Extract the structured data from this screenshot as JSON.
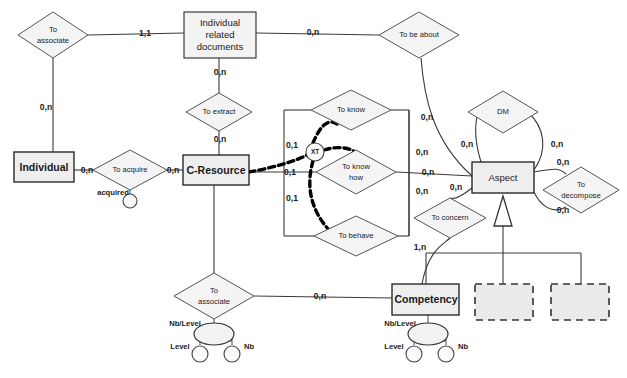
{
  "diagram": {
    "type": "entity-relationship-diagram",
    "entities": [
      {
        "id": "individual",
        "label": "Individual",
        "x": 14,
        "y": 152,
        "w": 60,
        "h": 30
      },
      {
        "id": "individual-related-documents",
        "label_lines": [
          "Individual",
          "related",
          "documents"
        ],
        "x": 184,
        "y": 12,
        "w": 72,
        "h": 46
      },
      {
        "id": "c-resource",
        "label": "C-Resource",
        "x": 183,
        "y": 155,
        "w": 66,
        "h": 30
      },
      {
        "id": "aspect",
        "label": "Aspect",
        "x": 472,
        "y": 162,
        "w": 62,
        "h": 31
      },
      {
        "id": "competency",
        "label": "Competency",
        "x": 392,
        "y": 284,
        "w": 67,
        "h": 31
      }
    ],
    "placeholder_entities": [
      {
        "id": "placeholder-1",
        "x": 475,
        "y": 284,
        "w": 58,
        "h": 36
      },
      {
        "id": "placeholder-2",
        "x": 551,
        "y": 284,
        "w": 58,
        "h": 36
      }
    ],
    "relationships": [
      {
        "id": "to-associate-top",
        "label_lines": [
          "To",
          "associate"
        ],
        "cx": 53,
        "cy": 35,
        "rx": 35,
        "ry": 23
      },
      {
        "id": "to-be-about",
        "label": "To be about",
        "cx": 419,
        "cy": 35,
        "rx": 40,
        "ry": 23
      },
      {
        "id": "to-extract",
        "label": "To extract",
        "cx": 219,
        "cy": 112,
        "rx": 33,
        "ry": 19
      },
      {
        "id": "to-acquire",
        "label": "To  acquire",
        "cx": 130,
        "cy": 170,
        "rx": 37,
        "ry": 20
      },
      {
        "id": "to-know",
        "label": "To know",
        "cx": 351,
        "cy": 110,
        "rx": 40,
        "ry": 20
      },
      {
        "id": "to-know-how",
        "label_lines": [
          "To know",
          "how"
        ],
        "cx": 356,
        "cy": 172,
        "rx": 40,
        "ry": 22
      },
      {
        "id": "to-behave",
        "label": "To behave",
        "cx": 356,
        "cy": 236,
        "rx": 42,
        "ry": 20
      },
      {
        "id": "dm",
        "label": "DM",
        "cx": 503,
        "cy": 112,
        "rx": 35,
        "ry": 21
      },
      {
        "id": "to-decompose",
        "label_lines": [
          "To",
          "decompose"
        ],
        "cx": 581,
        "cy": 190,
        "rx": 38,
        "ry": 23
      },
      {
        "id": "to-concern",
        "label": "To concern",
        "cx": 450,
        "cy": 218,
        "rx": 36,
        "ry": 20
      },
      {
        "id": "to-associate-bottom",
        "label_lines": [
          "To",
          "associate"
        ],
        "cx": 214,
        "cy": 296,
        "rx": 40,
        "ry": 23
      }
    ],
    "exclusive_constraint": {
      "id": "xt",
      "label": "XT",
      "cx": 315,
      "cy": 152,
      "r": 9
    },
    "cardinalities": [
      {
        "id": "card-associate-doc",
        "value": "1,1",
        "x": 145,
        "y": 34
      },
      {
        "id": "card-associate-individual",
        "value": "0,n",
        "x": 46,
        "y": 108
      },
      {
        "id": "card-doc-about",
        "value": "0,n",
        "x": 313,
        "y": 33
      },
      {
        "id": "card-doc-extract",
        "value": "0,n",
        "x": 220,
        "y": 73
      },
      {
        "id": "card-extract-cresource",
        "value": "0,n",
        "x": 220,
        "y": 140
      },
      {
        "id": "card-individual-acquire",
        "value": "0,n",
        "x": 87,
        "y": 171
      },
      {
        "id": "card-acquire-cresource",
        "value": "0,n",
        "x": 173,
        "y": 171
      },
      {
        "id": "card-cresource-know",
        "value": "0,1",
        "x": 292,
        "y": 146
      },
      {
        "id": "card-cresource-knowhow",
        "value": "0,1",
        "x": 290,
        "y": 173
      },
      {
        "id": "card-cresource-behave",
        "value": "0,1",
        "x": 292,
        "y": 199
      },
      {
        "id": "card-about-aspect",
        "value": "0,n",
        "x": 427,
        "y": 118
      },
      {
        "id": "card-know-aspect",
        "value": "0,n",
        "x": 422,
        "y": 153
      },
      {
        "id": "card-knowhow-aspect",
        "value": "0,n",
        "x": 428,
        "y": 173
      },
      {
        "id": "card-behave-aspect",
        "value": "0,n",
        "x": 422,
        "y": 192
      },
      {
        "id": "card-dm-left",
        "value": "0,n",
        "x": 467,
        "y": 145
      },
      {
        "id": "card-dm-right",
        "value": "0,n",
        "x": 557,
        "y": 145
      },
      {
        "id": "card-decompose-top",
        "value": "0,n",
        "x": 563,
        "y": 163
      },
      {
        "id": "card-decompose-bottom",
        "value": "0,n",
        "x": 563,
        "y": 211
      },
      {
        "id": "card-aspect-concern",
        "value": "0,n",
        "x": 456,
        "y": 188
      },
      {
        "id": "card-concern-competency",
        "value": "1,n",
        "x": 420,
        "y": 248
      },
      {
        "id": "card-associate-competency",
        "value": "0,n",
        "x": 320,
        "y": 297
      }
    ],
    "attributes": [
      {
        "id": "acquired",
        "label": "acquired",
        "x": 113,
        "y": 193,
        "cx": 130,
        "cy": 201,
        "r": 7
      },
      {
        "id": "nb-level-left",
        "label": "Nb/Level",
        "x": 185,
        "y": 324,
        "ell_cx": 214,
        "ell_cy": 334,
        "ell_rx": 20,
        "ell_ry": 11
      },
      {
        "id": "level-left",
        "label": "Level",
        "x": 180,
        "y": 347,
        "cx": 200,
        "cy": 356,
        "r": 8
      },
      {
        "id": "nb-left",
        "label": "Nb",
        "x": 249,
        "y": 347,
        "cx": 232,
        "cy": 356,
        "r": 8
      },
      {
        "id": "nb-level-right",
        "label": "Nb/Level",
        "x": 400,
        "y": 324,
        "ell_cx": 428,
        "ell_cy": 334,
        "ell_rx": 20,
        "ell_ry": 11
      },
      {
        "id": "level-right",
        "label": "Level",
        "x": 394,
        "y": 347,
        "cx": 414,
        "cy": 356,
        "r": 8
      },
      {
        "id": "nb-right",
        "label": "Nb",
        "x": 463,
        "y": 347,
        "cx": 446,
        "cy": 356,
        "r": 8
      }
    ],
    "colors": {
      "entity_fill": "#eeeeee",
      "line": "#3a3a3a",
      "xor_line": "#000000",
      "placeholder_fill": "#eaeaea",
      "background": "#ffffff"
    }
  }
}
